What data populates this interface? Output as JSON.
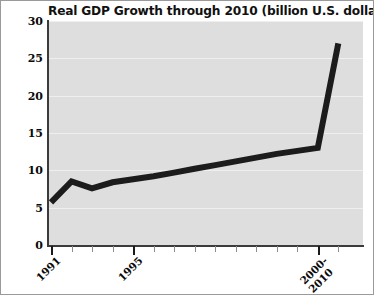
{
  "chart_data": {
    "type": "line",
    "title": "Real GDP Growth through 2010 (billion U.S. dollars)",
    "xlabel": "",
    "ylabel": "",
    "ylim": [
      0,
      30
    ],
    "yticks": [
      0,
      5,
      10,
      15,
      20,
      25,
      30
    ],
    "ytick_labels": [
      "0",
      "5",
      "10",
      "15",
      "20",
      "25",
      "30"
    ],
    "xtick_labels": [
      "1991",
      "1995",
      "2000-\n2010"
    ],
    "xtick_label_positions": [
      0,
      4,
      13
    ],
    "grid": true,
    "legend": null,
    "line_color": "#1c1c1c",
    "plot_background": "#dedede",
    "gridline_color": "#efefef",
    "x": [
      1991,
      1992,
      1993,
      1994,
      1995,
      1996,
      1997,
      1998,
      1999,
      2000,
      2001,
      2002,
      2003,
      2004,
      2010
    ],
    "values": [
      5.7,
      8.5,
      7.6,
      8.4,
      8.8,
      9.2,
      9.7,
      10.2,
      10.7,
      11.2,
      11.7,
      12.2,
      12.6,
      13.0,
      27.0
    ],
    "series": [
      {
        "name": "Real GDP",
        "values": [
          5.7,
          8.5,
          7.6,
          8.4,
          8.8,
          9.2,
          9.7,
          10.2,
          10.7,
          11.2,
          11.7,
          12.2,
          12.6,
          13.0,
          27.0
        ]
      }
    ],
    "annotations": []
  },
  "axes": {
    "y_tick_values": [
      30,
      25,
      20,
      15,
      10,
      5,
      0
    ],
    "x_ticks_count": 15
  }
}
